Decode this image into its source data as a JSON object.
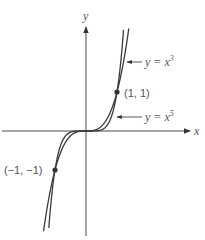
{
  "chart_data": {
    "type": "line",
    "title": "",
    "xlabel": "x",
    "ylabel": "y",
    "grid": false,
    "legend": "none (inline arrow annotations)",
    "xlim": [
      -2.8,
      3.4
    ],
    "ylim": [
      -2.7,
      2.6
    ],
    "series": [
      {
        "name": "y = x^3",
        "label": "y = x",
        "exponent": 3,
        "exponent_label": "3",
        "function": "x^3"
      },
      {
        "name": "y = x^5",
        "label": "y = x",
        "exponent": 5,
        "exponent_label": "5",
        "function": "x^5"
      }
    ],
    "points": [
      {
        "x": 1,
        "y": 1,
        "label": "(1, 1)"
      },
      {
        "x": -1,
        "y": -1,
        "label": "(−1, −1)"
      }
    ],
    "annotations": [
      {
        "text": "y = x^3",
        "target_series": "y = x^3",
        "style": "arrow pointing left"
      },
      {
        "text": "y = x^5",
        "target_series": "y = x^5",
        "style": "arrow pointing left"
      }
    ]
  },
  "axes": {
    "x_label": "x",
    "y_label": "y"
  },
  "labels": {
    "cube_eq": "y = x",
    "cube_exp": "3",
    "fifth_eq": "y = x",
    "fifth_exp": "5",
    "point_pos": "(1, 1)",
    "point_neg": "(−1, −1)"
  },
  "colors": {
    "axis": "#4a4a4a",
    "curve": "#3a3a3a",
    "text": "#555555",
    "background": "#ffffff"
  }
}
